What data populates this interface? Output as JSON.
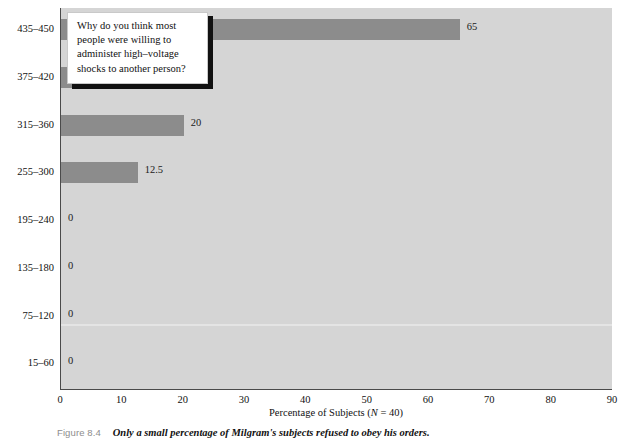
{
  "chart_data": {
    "type": "bar",
    "orientation": "horizontal",
    "title": "",
    "xlabel": "Percentage of Subjects (N = 40)",
    "xlabel_parts": {
      "pre": "Percentage of Subjects (",
      "italic": "N",
      "post": " = 40)"
    },
    "ylabel": "Maximum Shock Used by Subject",
    "categories": [
      "15–60",
      "75–120",
      "135–180",
      "195–240",
      "255–300",
      "315–360",
      "375–420",
      "435–450"
    ],
    "values": [
      0,
      0,
      0,
      0,
      12.5,
      20,
      2.5,
      65
    ],
    "value_labels": [
      "0",
      "0",
      "0",
      "0",
      "12.5",
      "20",
      "2.5",
      "65"
    ],
    "xlim": [
      0,
      90
    ],
    "xticks": [
      0,
      10,
      20,
      30,
      40,
      50,
      60,
      70,
      80,
      90
    ],
    "xtick_labels": [
      "0",
      "10",
      "20",
      "30",
      "40",
      "50",
      "60",
      "70",
      "80",
      "90"
    ],
    "grid": false,
    "legend": null,
    "bar_color": "#8c8c8c",
    "plot_background": "#d5d5d5",
    "axis_color": "#4a4a4a"
  },
  "callout": {
    "text": "Why do you think most people were willing to administer high–voltage shocks to another person?",
    "background": "#ffffff",
    "shadow_color": "#111111"
  },
  "caption": {
    "label": "Figure 8.4",
    "text": "Only a small percentage of Milgram's subjects refused to obey his orders.",
    "label_color": "#8d8d8d"
  }
}
